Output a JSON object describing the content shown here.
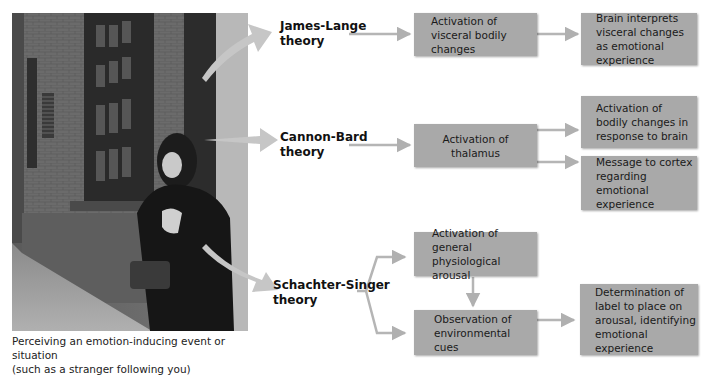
{
  "photo": {
    "description": "Woman clutching her bag, glancing over her shoulder in a brick-walled alley",
    "caption_line1": "Perceiving an emotion-inducing event or situation",
    "caption_line2": "(such as a stranger following you)"
  },
  "theories": [
    {
      "name_line1": "James-Lange",
      "name_line2": "theory",
      "steps": [
        "Activation of visceral bodily changes",
        "Brain interprets visceral changes as emotional experience"
      ]
    },
    {
      "name_line1": "Cannon-Bard",
      "name_line2": "theory",
      "steps": [
        "Activation of thalamus",
        "Activation of bodily changes in response to brain",
        "Message to cortex regarding emotional experience"
      ]
    },
    {
      "name_line1": "Schachter-Singer",
      "name_line2": "theory",
      "steps": [
        "Activation of general physiological arousal",
        "Observation of environmental cues",
        "Determination of label to place on arousal, identifying emotional experience"
      ]
    }
  ],
  "colors": {
    "box_fill": "#a9a9a9",
    "arrow": "#b5b5b5",
    "text": "#1a1a1a"
  }
}
